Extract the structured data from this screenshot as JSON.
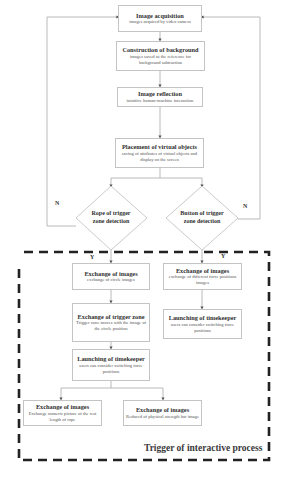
{
  "diagram": {
    "top_flow": [
      {
        "title": "Image acquisition",
        "subtitle": "images acquired by video camera"
      },
      {
        "title": "Construction of background",
        "subtitle": "images saved as the reference for background subtraction"
      },
      {
        "title": "Image reflection",
        "subtitle": "intuitive human-machine interaction"
      },
      {
        "title": "Placement of virtual objects",
        "subtitle": "saving of attributes of virtual objects and display on the screen"
      }
    ],
    "decisions": {
      "left": {
        "label": "Rope of trigger zone detection",
        "line1": "Rope of trigger",
        "line2": "zone detection",
        "no_label": "N",
        "yes_label": "Y"
      },
      "right": {
        "label": "Button of trigger zone detection",
        "line1": "Button of trigger",
        "line2": "zone detection",
        "no_label": "N",
        "yes_label": "Y"
      }
    },
    "left_branch": [
      {
        "title": "Exchange of images",
        "subtitle": "exchange of circle images"
      },
      {
        "title": "Exchange of trigger zone",
        "subtitle": "Trigger zone moves with the image of the circle position"
      },
      {
        "title": "Launching of timekeeper",
        "subtitle": "users can consider switching force positions"
      }
    ],
    "right_branch": [
      {
        "title": "Exchange of images",
        "subtitle": "exchange of different force positions images"
      },
      {
        "title": "Launching of timekeeper",
        "subtitle": "users can consider switching force positions"
      }
    ],
    "bottom_outputs": [
      {
        "title": "Exchange of images",
        "subtitle": "Exchange numeric picture of the rest length of rope"
      },
      {
        "title": "Exchange of images",
        "subtitle": "Reduced of physical strength bar image"
      }
    ],
    "group_caption": "Trigger of interactive process",
    "colors": {
      "box_border": "#c4c4c4",
      "line": "#999999",
      "dashed_border": "#222222"
    }
  }
}
